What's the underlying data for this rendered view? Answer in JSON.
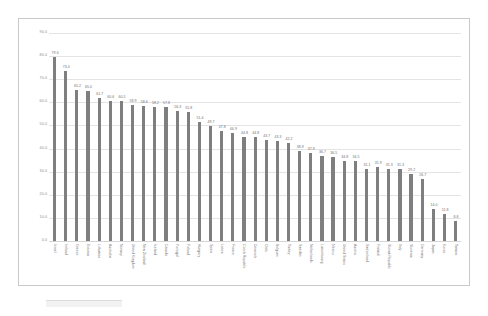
{
  "panel": {
    "name": "chart-panel"
  },
  "chart_data": {
    "type": "bar",
    "title": "",
    "subtitle": "",
    "xlabel": "",
    "ylabel": "",
    "ylim": [
      0.0,
      90.0
    ],
    "grid": true,
    "legend": "none",
    "orientation": "vertical",
    "bar_color": "#7f7f7f",
    "y_ticks": [
      "90.0",
      "80.0",
      "70.0",
      "60.0",
      "50.0",
      "40.0",
      "30.0",
      "20.0",
      "10.0",
      "0.0"
    ],
    "y_tick_values": [
      90.0,
      80.0,
      70.0,
      60.0,
      50.0,
      40.0,
      30.0,
      20.0,
      10.0,
      0.0
    ],
    "categories": [
      "Israel",
      "Ireland",
      "Greece",
      "Estonia",
      "Lithuania",
      "Australia",
      "Norway",
      "United Kingdom",
      "New Zealand",
      "Iceland",
      "Canada",
      "Portugal",
      "Poland",
      "Hungary",
      "Spain",
      "Latvia",
      "France",
      "Czech Republic",
      "Denmark",
      "Chile",
      "Belgium",
      "Turkey",
      "Sweden",
      "Netherlands",
      "Luxembourg",
      "Mexico",
      "United States",
      "Austria",
      "Switzerland",
      "Finland",
      "Slovak Republic",
      "Italy",
      "Slovenia",
      "Germany",
      "Japan",
      "Korea",
      "Taiwan"
    ],
    "values": [
      79.6,
      73.4,
      65.2,
      65.0,
      61.7,
      60.6,
      60.5,
      58.9,
      58.6,
      58.2,
      57.8,
      56.3,
      55.8,
      51.4,
      49.7,
      47.8,
      46.9,
      44.8,
      44.8,
      43.7,
      43.3,
      42.2,
      38.9,
      37.9,
      36.7,
      36.5,
      34.8,
      34.5,
      31.1,
      31.9,
      31.3,
      31.3,
      29.2,
      26.7,
      14.0,
      11.8,
      8.8
    ],
    "value_labels": [
      "79.6",
      "73.4",
      "65.2",
      "65.0",
      "61.7",
      "60.6",
      "60.5",
      "58.9",
      "58.6",
      "58.2",
      "57.8",
      "56.3",
      "55.8",
      "51.4",
      "49.7",
      "47.8",
      "46.9",
      "44.8",
      "44.8",
      "43.7",
      "43.3",
      "42.2",
      "38.9",
      "37.9",
      "36.7",
      "36.5",
      "34.8",
      "34.5",
      "31.1",
      "31.9",
      "31.3",
      "31.3",
      "29.2",
      "26.7",
      "14.0",
      "11.8",
      "8.8"
    ]
  }
}
